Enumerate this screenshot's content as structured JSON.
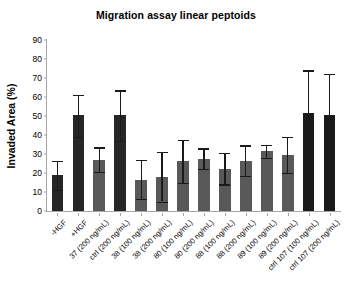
{
  "chart_data": {
    "type": "bar",
    "title": "Migration assay linear peptoids",
    "xlabel": "",
    "ylabel": "Invaded Area (%)",
    "ylim": [
      0,
      90
    ],
    "ytick_step": 10,
    "yticks": [
      "0",
      "10",
      "20",
      "30",
      "40",
      "50",
      "60",
      "70",
      "80",
      "90"
    ],
    "grid": false,
    "legend": "none",
    "categories": [
      "-HGF",
      "+HGF",
      "37 (200 ng/mL)",
      "ctrl (200 ng/mL)",
      "38 (100 ng/mL)",
      "38 (200 ng/mL)",
      "80 (100 ng/mL)",
      "80 (200 ng/mL)",
      "88 (100 ng/mL)",
      "88 (200 ng/mL)",
      "89 (100 ng/mL)",
      "89 (200 ng/mL)",
      "ctrl 107 (100 ng/mL)",
      "ctrl 107 (200 ng/mL)"
    ],
    "values": [
      19,
      50.3,
      27,
      50.5,
      16.5,
      18,
      26.5,
      27.5,
      22,
      26.5,
      31.5,
      29.5,
      51.5,
      50.5
    ],
    "error_low": [
      11.3,
      39,
      20.5,
      37,
      6.3,
      5,
      15,
      22,
      14,
      18.5,
      28,
      20,
      27.5,
      29.5
    ],
    "error_high": [
      26.5,
      61,
      33.5,
      63.5,
      27,
      31,
      37.5,
      33,
      30.5,
      34.5,
      34.8,
      39,
      74,
      72
    ],
    "bar_colors": [
      "#262626",
      "#262626",
      "#595959",
      "#262626",
      "#595959",
      "#595959",
      "#595959",
      "#595959",
      "#595959",
      "#595959",
      "#595959",
      "#595959",
      "#1a1a1a",
      "#1a1a1a"
    ],
    "axis_color": "#a6a6a6",
    "error_color": "#1a1a1a",
    "background": "#ffffff"
  }
}
